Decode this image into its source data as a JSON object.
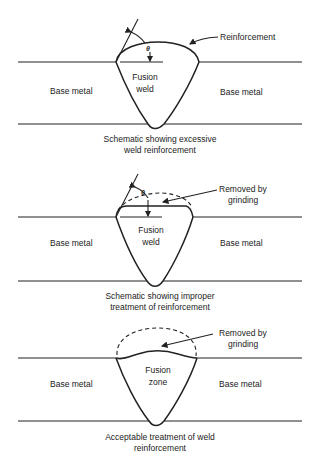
{
  "panels": [
    {
      "id": "excessive",
      "base_metal_left": "Base metal",
      "base_metal_right": "Base metal",
      "weld_label_line1": "Fusion",
      "weld_label_line2": "weld",
      "callout": "Reinforcement",
      "angle_symbol": "θ",
      "caption_line1": "Schematic showing excessive",
      "caption_line2": "weld reinforcement"
    },
    {
      "id": "improper",
      "base_metal_left": "Base metal",
      "base_metal_right": "Base metal",
      "weld_label_line1": "Fusion",
      "weld_label_line2": "weld",
      "callout_line1": "Removed by",
      "callout_line2": "grinding",
      "angle_symbol": "θ",
      "caption_line1": "Schematic showing improper",
      "caption_line2": "treatment of reinforcement"
    },
    {
      "id": "acceptable",
      "base_metal_left": "Base metal",
      "base_metal_right": "Base metal",
      "weld_label_line1": "Fusion",
      "weld_label_line2": "zone",
      "callout_line1": "Removed by",
      "callout_line2": "grinding",
      "caption_line1": "Acceptable treatment of weld",
      "caption_line2": "reinforcement"
    }
  ]
}
